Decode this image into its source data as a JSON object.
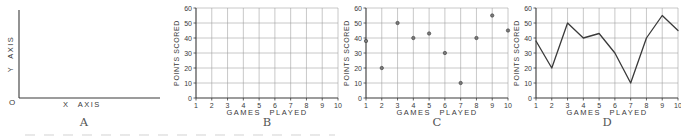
{
  "figure": {
    "colors": {
      "ink": "#3a3a3a",
      "grid": "#9b9b9b",
      "paper": "#ffffff",
      "point_fill": "#7a7a7a"
    },
    "panels": [
      {
        "letter": "A",
        "y_axis_label": "Y AXIS",
        "x_axis_label": "X AXIS",
        "origin_label": "O"
      },
      {
        "letter": "B",
        "y_axis_label": "POINTS SCORED",
        "x_axis_label": "GAMES PLAYED"
      },
      {
        "letter": "C",
        "y_axis_label": "POINTS SCORED",
        "x_axis_label": "GAMES PLAYED"
      },
      {
        "letter": "D",
        "y_axis_label": "POINTS SCORED",
        "x_axis_label": "GAMES PLAYED"
      }
    ]
  },
  "chart_data": [
    {
      "type": "axes-only",
      "panel": "A",
      "title": "",
      "xlabel": "X AXIS",
      "ylabel": "Y AXIS",
      "origin_label": "O"
    },
    {
      "type": "grid",
      "panel": "B",
      "title": "",
      "xlabel": "GAMES PLAYED",
      "ylabel": "POINTS SCORED",
      "xticks": [
        1,
        2,
        3,
        4,
        5,
        6,
        7,
        8,
        9,
        10
      ],
      "yticks": [
        0,
        10,
        20,
        30,
        40,
        50,
        60
      ],
      "xlim": [
        1,
        10
      ],
      "ylim": [
        0,
        60
      ],
      "grid": true,
      "x": [],
      "values": []
    },
    {
      "type": "scatter",
      "panel": "C",
      "title": "",
      "xlabel": "GAMES PLAYED",
      "ylabel": "POINTS SCORED",
      "xticks": [
        1,
        2,
        3,
        4,
        5,
        6,
        7,
        8,
        9,
        10
      ],
      "yticks": [
        0,
        10,
        20,
        30,
        40,
        50,
        60
      ],
      "xlim": [
        1,
        10
      ],
      "ylim": [
        0,
        60
      ],
      "grid": true,
      "x": [
        1,
        2,
        3,
        4,
        5,
        6,
        7,
        8,
        9,
        10
      ],
      "values": [
        38,
        20,
        50,
        40,
        43,
        30,
        10,
        40,
        55,
        45
      ]
    },
    {
      "type": "line",
      "panel": "D",
      "title": "",
      "xlabel": "GAMES PLAYED",
      "ylabel": "POINTS SCORED",
      "xticks": [
        1,
        2,
        3,
        4,
        5,
        6,
        7,
        8,
        9,
        10
      ],
      "yticks": [
        0,
        10,
        20,
        30,
        40,
        50,
        60
      ],
      "xlim": [
        1,
        10
      ],
      "ylim": [
        0,
        60
      ],
      "grid": true,
      "x": [
        1,
        2,
        3,
        4,
        5,
        6,
        7,
        8,
        9,
        10
      ],
      "values": [
        38,
        20,
        50,
        40,
        43,
        30,
        10,
        40,
        55,
        45
      ]
    }
  ]
}
